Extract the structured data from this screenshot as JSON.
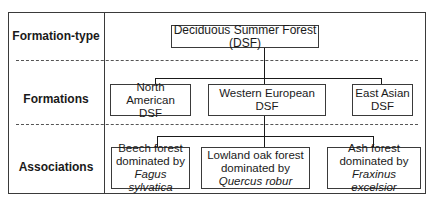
{
  "rows": {
    "formation_type": "Formation-type",
    "formations": "Formations",
    "associations": "Associations"
  },
  "formation_type": {
    "label": "Deciduous Summer Forest (DSF)"
  },
  "formations": [
    {
      "line1": "North American",
      "line2": "DSF"
    },
    {
      "line1": "Western European",
      "line2": "DSF"
    },
    {
      "line1": "East Asian",
      "line2": "DSF"
    }
  ],
  "associations": [
    {
      "line1": "Beech forest",
      "line2": "dominated by",
      "species": "Fagus sylvatica"
    },
    {
      "line1": "Lowland oak forest",
      "line2": "dominated by",
      "species": "Quercus robur"
    },
    {
      "line1": "Ash forest",
      "line2": "dominated by",
      "species": "Fraxinus excelsior"
    }
  ]
}
